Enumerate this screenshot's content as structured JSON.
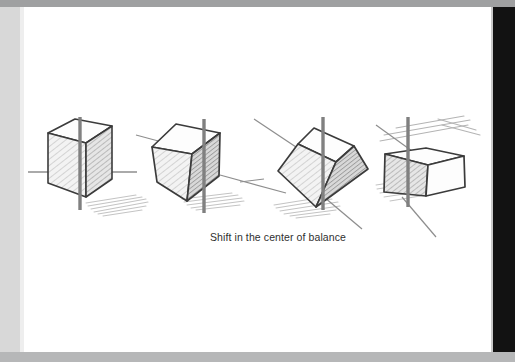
{
  "window": {
    "page_background": "#ffffff",
    "left_margin_color": "#d8d8d8",
    "right_panel_color": "#121212",
    "top_bar_color": "#9fa0a1",
    "bottom_bar_color": "#b6b7b8"
  },
  "illustration": {
    "title": "Shift in the center of balance",
    "medium": "pencil sketch",
    "subject": "four cubes with vertical balance axis",
    "line_color": "#3a3a3a",
    "axis_color": "#808080",
    "shading_color": "#b9b9b9",
    "shadow_color": "#c6c6c6",
    "figures": [
      {
        "index": 1,
        "label": "upright cube",
        "description": "cube resting flat, vertical axis through center, horizontal ground line",
        "tilt_degrees": 0
      },
      {
        "index": 2,
        "label": "tilted cube",
        "description": "cube rotated slightly, ground line sloping, axis shifted off center",
        "tilt_degrees": 15
      },
      {
        "index": 3,
        "label": "cube balanced on corner",
        "description": "cube rotated far, resting on one corner, axis crosses the corner",
        "tilt_degrees": 40
      },
      {
        "index": 4,
        "label": "cube falling",
        "description": "cube tipped past balance with motion lines above",
        "tilt_degrees": 55
      }
    ]
  },
  "caption": {
    "text": "Shift in the center of balance"
  }
}
